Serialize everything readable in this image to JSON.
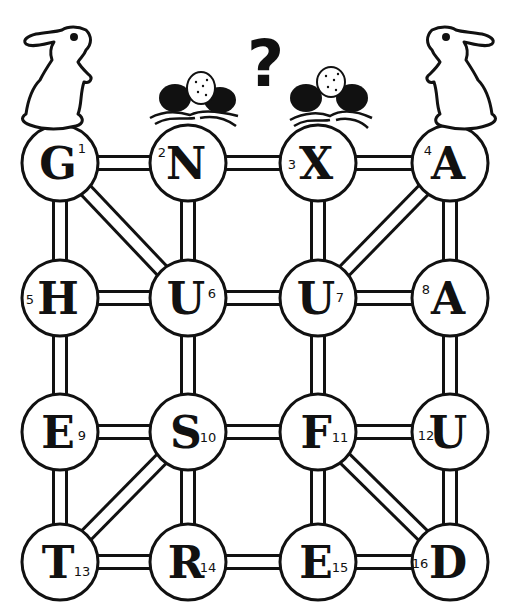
{
  "puzzle": {
    "question_mark": "?",
    "colors": {
      "ink": "#111111",
      "paper": "#ffffff"
    },
    "nodes": [
      {
        "id": 1,
        "letter": "G",
        "num": "1",
        "row": 0,
        "col": 0
      },
      {
        "id": 2,
        "letter": "N",
        "num": "2",
        "row": 0,
        "col": 1
      },
      {
        "id": 3,
        "letter": "X",
        "num": "3",
        "row": 0,
        "col": 2
      },
      {
        "id": 4,
        "letter": "A",
        "num": "4",
        "row": 0,
        "col": 3
      },
      {
        "id": 5,
        "letter": "H",
        "num": "5",
        "row": 1,
        "col": 0
      },
      {
        "id": 6,
        "letter": "U",
        "num": "6",
        "row": 1,
        "col": 1
      },
      {
        "id": 7,
        "letter": "U",
        "num": "7",
        "row": 1,
        "col": 2
      },
      {
        "id": 8,
        "letter": "A",
        "num": "8",
        "row": 1,
        "col": 3
      },
      {
        "id": 9,
        "letter": "E",
        "num": "9",
        "row": 2,
        "col": 0
      },
      {
        "id": 10,
        "letter": "S",
        "num": "10",
        "row": 2,
        "col": 1
      },
      {
        "id": 11,
        "letter": "F",
        "num": "11",
        "row": 2,
        "col": 2
      },
      {
        "id": 12,
        "letter": "U",
        "num": "12",
        "row": 2,
        "col": 3
      },
      {
        "id": 13,
        "letter": "T",
        "num": "13",
        "row": 3,
        "col": 0
      },
      {
        "id": 14,
        "letter": "R",
        "num": "14",
        "row": 3,
        "col": 1
      },
      {
        "id": 15,
        "letter": "E",
        "num": "15",
        "row": 3,
        "col": 2
      },
      {
        "id": 16,
        "letter": "D",
        "num": "16",
        "row": 3,
        "col": 3
      }
    ],
    "edges": [
      [
        1,
        2
      ],
      [
        2,
        3
      ],
      [
        3,
        4
      ],
      [
        5,
        6
      ],
      [
        6,
        7
      ],
      [
        7,
        8
      ],
      [
        9,
        10
      ],
      [
        10,
        11
      ],
      [
        11,
        12
      ],
      [
        13,
        14
      ],
      [
        14,
        15
      ],
      [
        15,
        16
      ],
      [
        1,
        5
      ],
      [
        5,
        9
      ],
      [
        9,
        13
      ],
      [
        2,
        6
      ],
      [
        6,
        10
      ],
      [
        10,
        14
      ],
      [
        3,
        7
      ],
      [
        7,
        11
      ],
      [
        11,
        15
      ],
      [
        4,
        8
      ],
      [
        8,
        12
      ],
      [
        12,
        16
      ],
      [
        1,
        6
      ],
      [
        4,
        7
      ],
      [
        10,
        13
      ],
      [
        11,
        16
      ]
    ],
    "decorations": [
      "rabbit-left",
      "nest-with-eggs-2",
      "question-mark",
      "nest-with-eggs-3",
      "rabbit-right"
    ]
  }
}
